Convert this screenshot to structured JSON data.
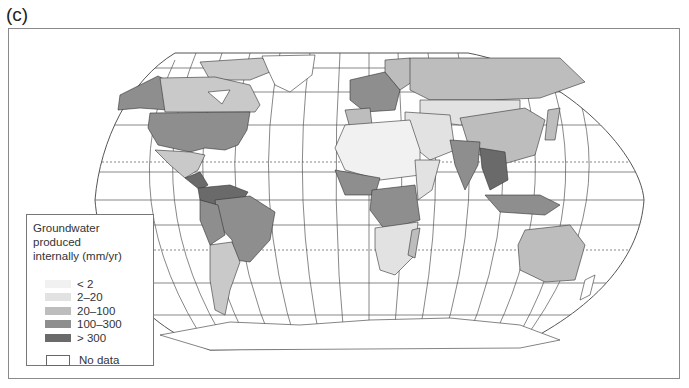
{
  "panel_label": "(c)",
  "map": {
    "title": "Groundwater produced internally (mm/yr)",
    "projection": "Robinson-like world map with graticule",
    "legend": {
      "title_line1": "Groundwater produced",
      "title_line2": "internally (mm/yr)",
      "items": [
        {
          "label": "< 2",
          "color": "#f1f1f1"
        },
        {
          "label": "2–20",
          "color": "#e2e2e2"
        },
        {
          "label": "20–100",
          "color": "#bdbdbd"
        },
        {
          "label": "100–300",
          "color": "#8e8e8e"
        },
        {
          "label": "> 300",
          "color": "#6a6a6a"
        }
      ],
      "no_data": {
        "label": "No data",
        "color": "#ffffff"
      }
    },
    "colors": {
      "lt2": "#f1f1f1",
      "c2_20": "#e2e2e2",
      "c20_100": "#bdbdbd",
      "c100_300": "#8e8e8e",
      "gt300": "#6a6a6a",
      "nodata": "#ffffff",
      "outline": "#333333",
      "graticule": "#444444"
    }
  }
}
